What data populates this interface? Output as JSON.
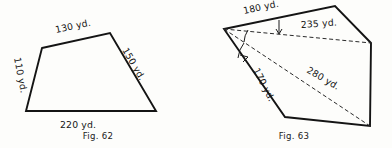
{
  "page": {
    "background_color": "#fdfdfb",
    "ink_color": "#141414"
  },
  "figures": [
    {
      "id": "fig-62",
      "caption": "Fig. 62",
      "shape": "quadrilateral",
      "vertices": [
        {
          "name": "top-left",
          "x": 42,
          "y": 48
        },
        {
          "name": "top-right",
          "x": 110,
          "y": 33
        },
        {
          "name": "bottom-right",
          "x": 156,
          "y": 111
        },
        {
          "name": "bottom-left",
          "x": 26,
          "y": 111
        }
      ],
      "edges": [
        {
          "name": "top-edge",
          "label": "130 yd.",
          "label_x": 56,
          "label_y": 33,
          "rotation": -12
        },
        {
          "name": "right-edge",
          "label": "150 yd.",
          "label_x": 122,
          "label_y": 50,
          "rotation": 60
        },
        {
          "name": "bottom-edge",
          "label": "220 yd.",
          "label_x": 60,
          "label_y": 128,
          "rotation": 0
        },
        {
          "name": "left-edge",
          "label": "110 yd.",
          "label_x": 14,
          "label_y": 58,
          "rotation": 79
        }
      ]
    },
    {
      "id": "fig-63",
      "caption": "Fig. 63",
      "shape": "pentagon",
      "vertices": [
        {
          "name": "left-apex",
          "x": 28,
          "y": 29
        },
        {
          "name": "top",
          "x": 139,
          "y": 6
        },
        {
          "name": "right",
          "x": 175,
          "y": 43
        },
        {
          "name": "bottom-right",
          "x": 174,
          "y": 126
        },
        {
          "name": "bottom-left",
          "x": 89,
          "y": 117
        }
      ],
      "edges": [
        {
          "name": "upper-left-edge",
          "label": "180 yd.",
          "label_x": 48,
          "label_y": 14,
          "rotation": -12
        },
        {
          "name": "lower-left-edge",
          "label": "170 yd.",
          "label_x": 57,
          "label_y": 68,
          "rotation": 63
        }
      ],
      "diagonals": [
        {
          "name": "diagonal-to-right-vertex",
          "from": "left-apex",
          "to": "right",
          "label": "235 yd.",
          "label_x": 108,
          "label_y": 28,
          "rotation": -5
        },
        {
          "name": "diagonal-to-bottom-right-vertex",
          "from": "left-apex",
          "to": "bottom-right",
          "label": "280 yd.",
          "label_x": 113,
          "label_y": 74,
          "rotation": 30
        }
      ],
      "angle_ticks": [
        {
          "name": "angle-tick-upper",
          "x1": 83,
          "y1": 20,
          "x2": 83,
          "y2": 34
        },
        {
          "name": "angle-tick-lower",
          "x1": 50,
          "y1": 60,
          "x2": 59,
          "y2": 54
        }
      ],
      "angle_arcs": [
        {
          "name": "angle-arc-upper",
          "path": "M 50 28 A 22 22 0 0 0 47 41"
        },
        {
          "name": "angle-arc-lower",
          "path": "M 47 41 A 30 30 0 0 0 41 57"
        }
      ]
    }
  ]
}
